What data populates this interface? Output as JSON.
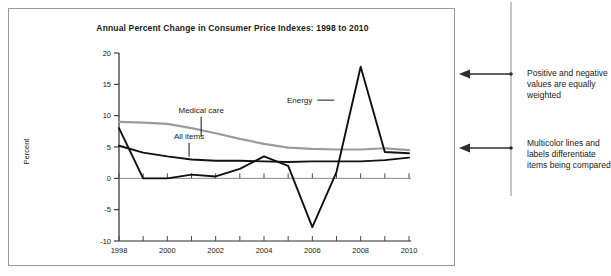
{
  "chart_data": {
    "type": "line",
    "title": "Annual Percent Change in Consumer Price Indexes: 1998 to 2010",
    "xlabel": "",
    "ylabel": "Percent",
    "xlim": [
      1998,
      2010
    ],
    "ylim": [
      -10,
      20
    ],
    "ytick_labels": [
      "20",
      "15",
      "10",
      "5",
      "0",
      "-5",
      "-10"
    ],
    "yticks": [
      20,
      15,
      10,
      5,
      0,
      -5,
      -10
    ],
    "xtick_labels": [
      "1998",
      "2000",
      "2002",
      "2004",
      "2006",
      "2008",
      "2010"
    ],
    "xticks": [
      1998,
      2000,
      2002,
      2004,
      2006,
      2008,
      2010
    ],
    "grid": false,
    "legend": "inline-labels",
    "x": [
      1998,
      1999,
      2000,
      2001,
      2002,
      2003,
      2004,
      2005,
      2006,
      2007,
      2008,
      2009,
      2010
    ],
    "series": [
      {
        "name": "Energy",
        "color": "#111111",
        "values": [
          8.0,
          0.0,
          0.0,
          0.6,
          0.3,
          1.5,
          3.5,
          2.0,
          -7.8,
          1.0,
          17.8,
          4.2,
          4.0
        ]
      },
      {
        "name": "Medical care",
        "color": "#9b9b9b",
        "values": [
          9.0,
          8.9,
          8.7,
          8.0,
          7.2,
          6.3,
          5.5,
          4.9,
          4.7,
          4.6,
          4.6,
          4.8,
          4.5
        ]
      },
      {
        "name": "All items",
        "color": "#111111",
        "values": [
          5.2,
          4.1,
          3.5,
          3.0,
          2.8,
          2.8,
          2.7,
          2.6,
          2.7,
          2.7,
          2.7,
          2.9,
          3.3
        ]
      }
    ],
    "annotations": [
      {
        "text": "Energy",
        "x": 2006.0,
        "y": 12.0
      },
      {
        "text": "Medical care",
        "x": 2001.4,
        "y": 10.5
      },
      {
        "text": "All items",
        "x": 2000.9,
        "y": 6.3
      }
    ]
  },
  "notes": {
    "note_1": "Positive and negative values are equally weighted",
    "note_2": "Multicolor lines and labels differentiate items being compared"
  },
  "icons": {
    "arrow_left": "left-arrow-icon"
  }
}
